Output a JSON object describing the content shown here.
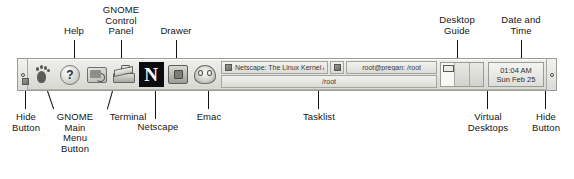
{
  "diagram": {
    "callouts_top": [
      {
        "name": "help",
        "text": "Help"
      },
      {
        "name": "gnome-control-panel",
        "text": "GNOME\nControl\nPanel"
      },
      {
        "name": "drawer",
        "text": "Drawer"
      },
      {
        "name": "desktop-guide",
        "text": "Desktop\nGuide"
      },
      {
        "name": "date-and-time",
        "text": "Date and\nTime"
      }
    ],
    "callouts_bottom": [
      {
        "name": "hide-button-left",
        "text": "Hide\nButton"
      },
      {
        "name": "gnome-main-menu-button",
        "text": "GNOME\nMain\nMenu\nButton"
      },
      {
        "name": "terminal",
        "text": "Terminal"
      },
      {
        "name": "netscape",
        "text": "Netscape"
      },
      {
        "name": "emac",
        "text": "Emac"
      },
      {
        "name": "tasklist",
        "text": "Tasklist"
      },
      {
        "name": "virtual-desktops",
        "text": "Virtual\nDesktops"
      },
      {
        "name": "hide-button-right",
        "text": "Hide\nButton"
      }
    ]
  },
  "panel": {
    "hide_button_left": {
      "icon": "hide-button-dot"
    },
    "hide_button_right": {
      "icon": "hide-button-dot"
    },
    "launchers": [
      {
        "name": "gnome-main-menu-button",
        "icon": "gnome-foot-icon",
        "label": "GNOME Main Menu"
      },
      {
        "name": "help-launcher",
        "icon": "question-mark-icon",
        "label": "Help",
        "glyph": "?"
      },
      {
        "name": "terminal-launcher",
        "icon": "terminal-icon",
        "label": "Terminal"
      },
      {
        "name": "control-panel-launcher",
        "icon": "toolbox-icon",
        "label": "GNOME Control Panel"
      },
      {
        "name": "netscape-launcher",
        "icon": "netscape-n-icon",
        "label": "Netscape",
        "glyph": "N"
      },
      {
        "name": "drawer-launcher",
        "icon": "drawer-icon",
        "label": "Drawer"
      },
      {
        "name": "emacs-launcher",
        "icon": "emacs-icon",
        "label": "Emac"
      }
    ],
    "tasklist": {
      "row1": [
        {
          "name": "task-netscape",
          "icon": "netscape-window-icon",
          "title": "Netscape: The Linux Kernel Archi"
        },
        {
          "name": "task-icon-only",
          "icon": "window-icon",
          "title": ""
        },
        {
          "name": "task-terminal",
          "icon": "",
          "title": "root@pregan: /root"
        }
      ],
      "row2": [
        {
          "name": "task-root",
          "icon": "window-icon",
          "title": "/root"
        }
      ]
    },
    "desktop_guide": {
      "name": "desktop-guide",
      "desktops": [
        {
          "name": "desktop-1",
          "active": true,
          "has_window": true
        },
        {
          "name": "desktop-2",
          "active": false,
          "has_window": false
        },
        {
          "name": "desktop-3",
          "active": false,
          "has_window": false
        }
      ]
    },
    "clock": {
      "name": "clock-applet",
      "time": "01:04 AM",
      "date": "Sun Feb 25"
    }
  }
}
